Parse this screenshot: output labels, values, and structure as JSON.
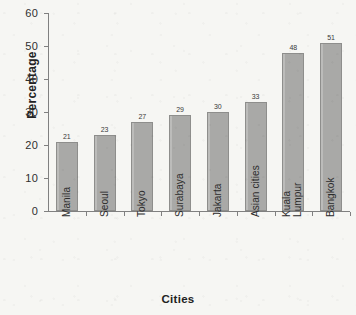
{
  "chart_data": {
    "type": "bar",
    "title": "",
    "xlabel": "Cities",
    "ylabel": "Percentage",
    "categories": [
      "Manila",
      "Seoul",
      "Tokyo",
      "Surabaya",
      "Jakarta",
      "Asian cities",
      "Kuala Lumpur",
      "Bangkok"
    ],
    "category_lines": [
      [
        "Manila"
      ],
      [
        "Seoul"
      ],
      [
        "Tokyo"
      ],
      [
        "Surabaya"
      ],
      [
        "Jakarta"
      ],
      [
        "Asian cities"
      ],
      [
        "Kuala",
        "Lumpur"
      ],
      [
        "Bangkok"
      ]
    ],
    "values": [
      21,
      23,
      27,
      29,
      30,
      33,
      48,
      51
    ],
    "value_labels": [
      "21",
      "23",
      "27",
      "29",
      "30",
      "33",
      "48",
      "51"
    ],
    "ylim": [
      0,
      60
    ],
    "ytick_labels": [
      "0",
      "10",
      "20",
      "30",
      "40",
      "50",
      "60"
    ],
    "ytick_values": [
      0,
      10,
      20,
      30,
      40,
      50,
      60
    ],
    "grid": false,
    "legend": "none",
    "bar_color": "#a9a9a7",
    "bar_edge_color": "#8e8e8c",
    "axis_color": "#808080",
    "background_color": "#f6f6f3",
    "text_color": "#2b2b2b"
  }
}
